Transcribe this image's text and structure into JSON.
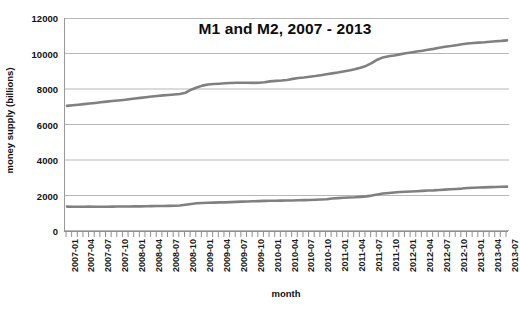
{
  "chart_data": {
    "type": "line",
    "title": "M1 and M2, 2007 - 2013",
    "xlabel": "month",
    "ylabel": "money supply (billions)",
    "ylim": [
      0,
      12000
    ],
    "y_ticks": [
      0,
      2000,
      4000,
      6000,
      8000,
      10000,
      12000
    ],
    "grid": true,
    "legend_position": "none",
    "line_color": "#808080",
    "categories": [
      "2007-01",
      "2007-02",
      "2007-03",
      "2007-04",
      "2007-05",
      "2007-06",
      "2007-07",
      "2007-08",
      "2007-09",
      "2007-10",
      "2007-11",
      "2007-12",
      "2008-01",
      "2008-02",
      "2008-03",
      "2008-04",
      "2008-05",
      "2008-06",
      "2008-07",
      "2008-08",
      "2008-09",
      "2008-10",
      "2008-11",
      "2008-12",
      "2009-01",
      "2009-02",
      "2009-03",
      "2009-04",
      "2009-05",
      "2009-06",
      "2009-07",
      "2009-08",
      "2009-09",
      "2009-10",
      "2009-11",
      "2009-12",
      "2010-01",
      "2010-02",
      "2010-03",
      "2010-04",
      "2010-05",
      "2010-06",
      "2010-07",
      "2010-08",
      "2010-09",
      "2010-10",
      "2010-11",
      "2010-12",
      "2011-01",
      "2011-02",
      "2011-03",
      "2011-04",
      "2011-05",
      "2011-06",
      "2011-07",
      "2011-08",
      "2011-09",
      "2011-10",
      "2011-11",
      "2011-12",
      "2012-01",
      "2012-02",
      "2012-03",
      "2012-04",
      "2012-05",
      "2012-06",
      "2012-07",
      "2012-08",
      "2012-09",
      "2012-10",
      "2012-11",
      "2012-12",
      "2013-01",
      "2013-02",
      "2013-03",
      "2013-04",
      "2013-05",
      "2013-06",
      "2013-07"
    ],
    "x_tick_labels": [
      "2007-01",
      "2007-04",
      "2007-07",
      "2007-10",
      "2008-01",
      "2008-04",
      "2008-07",
      "2008-10",
      "2009-01",
      "2009-04",
      "2009-07",
      "2009-10",
      "2010-01",
      "2010-04",
      "2010-07",
      "2010-10",
      "2011-01",
      "2011-04",
      "2011-07",
      "2011-10",
      "2012-01",
      "2012-04",
      "2012-07",
      "2012-10",
      "2013-01",
      "2013-04",
      "2013-07"
    ],
    "series": [
      {
        "name": "M2",
        "values": [
          7050,
          7080,
          7115,
          7150,
          7185,
          7215,
          7250,
          7290,
          7320,
          7350,
          7385,
          7420,
          7460,
          7500,
          7540,
          7575,
          7610,
          7640,
          7665,
          7690,
          7720,
          7790,
          7960,
          8080,
          8190,
          8250,
          8280,
          8300,
          8320,
          8340,
          8350,
          8355,
          8350,
          8345,
          8355,
          8380,
          8430,
          8460,
          8480,
          8510,
          8570,
          8620,
          8650,
          8690,
          8730,
          8780,
          8830,
          8880,
          8930,
          8990,
          9040,
          9110,
          9200,
          9300,
          9460,
          9650,
          9780,
          9840,
          9890,
          9950,
          10010,
          10060,
          10110,
          10160,
          10210,
          10260,
          10320,
          10380,
          10420,
          10470,
          10520,
          10560,
          10590,
          10610,
          10630,
          10660,
          10690,
          10710,
          10740
        ]
      },
      {
        "name": "M1",
        "values": [
          1375,
          1370,
          1365,
          1370,
          1375,
          1370,
          1368,
          1370,
          1375,
          1378,
          1380,
          1382,
          1385,
          1390,
          1395,
          1400,
          1405,
          1410,
          1415,
          1420,
          1435,
          1480,
          1520,
          1560,
          1580,
          1595,
          1600,
          1610,
          1615,
          1625,
          1640,
          1655,
          1665,
          1675,
          1685,
          1695,
          1700,
          1705,
          1710,
          1715,
          1720,
          1730,
          1740,
          1750,
          1760,
          1775,
          1790,
          1830,
          1850,
          1870,
          1890,
          1900,
          1925,
          1950,
          1995,
          2060,
          2110,
          2140,
          2170,
          2200,
          2210,
          2225,
          2240,
          2260,
          2280,
          2290,
          2310,
          2330,
          2350,
          2370,
          2390,
          2420,
          2440,
          2450,
          2460,
          2470,
          2480,
          2490,
          2500
        ]
      }
    ]
  }
}
